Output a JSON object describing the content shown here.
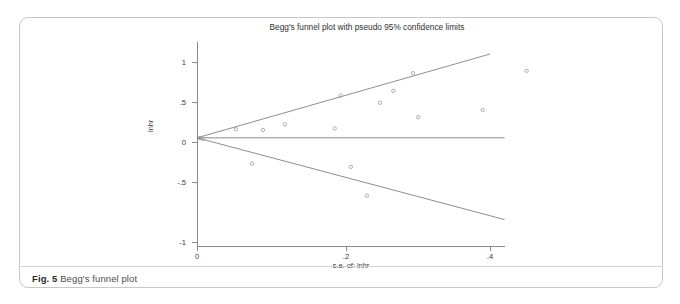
{
  "figure": {
    "caption_label": "Fig. 5",
    "caption_text": "Begg's funnel plot"
  },
  "chart_data": {
    "type": "scatter",
    "title": "Begg's funnel plot with pseudo 95% confidence limits",
    "xlabel": "s.e. of: lnhr",
    "ylabel": "lnhr",
    "xlim": [
      0,
      0.66
    ],
    "ylim": [
      -1.14,
      1.28
    ],
    "xticks": [
      0,
      0.2,
      0.4,
      0.6
    ],
    "xtick_labels": [
      "0",
      ".2",
      ".4",
      ".6"
    ],
    "yticks": [
      1,
      0.5,
      0,
      -0.5,
      -1
    ],
    "ytick_labels": [
      "1",
      ".5",
      "0",
      "-.5",
      "-1"
    ],
    "grid": false,
    "legend": false,
    "pooled_effect": 0.052,
    "pooled_line": {
      "label": "pooled effect estimate",
      "x_start": 0,
      "x_end": 0.42,
      "y": 0.052
    },
    "confidence_limits": {
      "label": "pseudo 95% confidence limits",
      "upper": {
        "x_start": 0,
        "y_start": 0.052,
        "x_end": 0.4,
        "y_end": 1.1
      },
      "lower": {
        "x_start": 0,
        "y_start": 0.052,
        "x_end": 0.42,
        "y_end": -0.97
      }
    },
    "points": [
      {
        "x": 0.004,
        "y": 0.05
      },
      {
        "x": 0.008,
        "y": 0.04
      },
      {
        "x": 0.053,
        "y": 0.16
      },
      {
        "x": 0.09,
        "y": 0.15
      },
      {
        "x": 0.075,
        "y": -0.27
      },
      {
        "x": 0.12,
        "y": 0.22
      },
      {
        "x": 0.188,
        "y": 0.17
      },
      {
        "x": 0.196,
        "y": 0.58
      },
      {
        "x": 0.25,
        "y": 0.49
      },
      {
        "x": 0.268,
        "y": 0.64
      },
      {
        "x": 0.21,
        "y": -0.31
      },
      {
        "x": 0.295,
        "y": 0.86
      },
      {
        "x": 0.302,
        "y": 0.31
      },
      {
        "x": 0.232,
        "y": -0.67
      },
      {
        "x": 0.39,
        "y": 0.4
      },
      {
        "x": 0.45,
        "y": 0.89
      }
    ]
  }
}
